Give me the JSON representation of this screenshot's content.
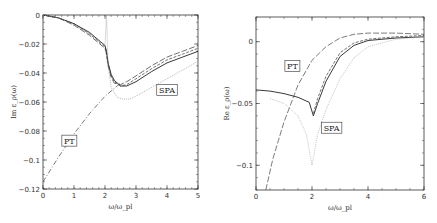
{
  "chart_data": [
    {
      "type": "line",
      "panel": "left",
      "ylabel": "Im ε_ρ(ω)",
      "xlabel": "ω/ω_pl",
      "xlim": [
        0,
        5
      ],
      "ylim": [
        -0.12,
        0
      ],
      "xticks": [
        "0",
        "1",
        "2",
        "3",
        "4",
        "5"
      ],
      "yticks": [
        "0",
        "-0.02",
        "-0.04",
        "-0.06",
        "-0.08",
        "-0.1",
        "-0.12"
      ],
      "grid": false,
      "annotations": [
        {
          "text": "PT",
          "x": 0.85,
          "y": -0.087
        },
        {
          "text": "SPA",
          "x": 4.0,
          "y": -0.052
        }
      ],
      "series": [
        {
          "name": "solid",
          "style": "solid",
          "color": "#222222",
          "x": [
            0,
            0.5,
            1.0,
            1.5,
            2.0,
            2.05,
            2.1,
            2.2,
            2.3,
            2.5,
            2.7,
            3.0,
            3.5,
            4.0,
            4.5,
            5.0
          ],
          "y": [
            0,
            -0.002,
            -0.006,
            -0.012,
            -0.021,
            -0.025,
            -0.033,
            -0.041,
            -0.045,
            -0.049,
            -0.049,
            -0.046,
            -0.039,
            -0.033,
            -0.029,
            -0.025
          ]
        },
        {
          "name": "dashed-short",
          "style": "dashed",
          "color": "#333333",
          "x": [
            0,
            0.5,
            1.0,
            1.5,
            2.0,
            2.05,
            2.1,
            2.2,
            2.3,
            2.5,
            2.7,
            3.0,
            3.5,
            4.0,
            4.5,
            5.0
          ],
          "y": [
            0,
            -0.002,
            -0.006,
            -0.013,
            -0.022,
            -0.026,
            -0.034,
            -0.042,
            -0.046,
            -0.049,
            -0.048,
            -0.044,
            -0.037,
            -0.031,
            -0.027,
            -0.023
          ]
        },
        {
          "name": "dashed-long",
          "style": "longdash",
          "color": "#333333",
          "x": [
            0,
            0.5,
            1.0,
            1.5,
            2.0,
            2.05,
            2.1,
            2.2,
            2.3,
            2.5,
            2.7,
            3.0,
            3.5,
            4.0,
            4.5,
            5.0
          ],
          "y": [
            0,
            -0.002,
            -0.007,
            -0.014,
            -0.023,
            -0.027,
            -0.035,
            -0.043,
            -0.047,
            -0.048,
            -0.046,
            -0.042,
            -0.035,
            -0.029,
            -0.025,
            -0.021
          ]
        },
        {
          "name": "SPA",
          "style": "dotted",
          "color": "#999999",
          "x": [
            0,
            0.5,
            1.0,
            1.5,
            2.0,
            2.05,
            2.1,
            2.2,
            2.4,
            2.6,
            2.8,
            3.0,
            3.5,
            4.0,
            4.5,
            5.0
          ],
          "y": [
            0,
            -0.002,
            -0.007,
            -0.013,
            -0.021,
            0,
            -0.035,
            -0.05,
            -0.057,
            -0.058,
            -0.058,
            -0.056,
            -0.05,
            -0.044,
            -0.038,
            -0.032
          ]
        },
        {
          "name": "PT",
          "style": "dashdot",
          "color": "#444444",
          "x": [
            0,
            0.5,
            1.0,
            1.5,
            2.0,
            2.5
          ],
          "y": [
            -0.115,
            -0.098,
            -0.082,
            -0.068,
            -0.056,
            -0.047
          ]
        }
      ]
    },
    {
      "type": "line",
      "panel": "right",
      "ylabel": "Re ε_ρ(ω)",
      "xlabel": "ω/ω_pl",
      "xlim": [
        0,
        6
      ],
      "ylim": [
        -0.12,
        0.02
      ],
      "xticks": [
        "0",
        "2",
        "4",
        "6"
      ],
      "yticks": [
        "0",
        "-0.05",
        "-0.1"
      ],
      "grid": false,
      "annotations": [
        {
          "text": "PT",
          "x": 1.3,
          "y": -0.02
        },
        {
          "text": "SPA",
          "x": 2.7,
          "y": -0.07
        }
      ],
      "series": [
        {
          "name": "solid",
          "style": "solid",
          "color": "#222222",
          "x": [
            0,
            0.5,
            1.0,
            1.5,
            1.9,
            2.05,
            2.2,
            2.5,
            3.0,
            3.5,
            4.0,
            5.0,
            6.0
          ],
          "y": [
            -0.039,
            -0.04,
            -0.042,
            -0.045,
            -0.049,
            -0.06,
            -0.05,
            -0.032,
            -0.012,
            -0.003,
            0.001,
            0.003,
            0.004
          ]
        },
        {
          "name": "dashed-short",
          "style": "dashed",
          "color": "#333333",
          "x": [
            2.05,
            2.2,
            2.5,
            3.0,
            3.5,
            4.0,
            5.0,
            6.0
          ],
          "y": [
            -0.058,
            -0.046,
            -0.028,
            -0.009,
            -0.001,
            0.002,
            0.004,
            0.005
          ]
        },
        {
          "name": "SPA",
          "style": "dotted",
          "color": "#aaaaaa",
          "x": [
            0.5,
            1.0,
            1.5,
            1.8,
            2.0,
            2.2,
            2.5,
            3.0,
            3.5,
            4.0,
            5.0,
            6.0
          ],
          "y": [
            -0.046,
            -0.05,
            -0.06,
            -0.075,
            -0.1,
            -0.075,
            -0.055,
            -0.03,
            -0.013,
            -0.004,
            0.002,
            0.004
          ]
        },
        {
          "name": "PT",
          "style": "longdash",
          "color": "#444444",
          "x": [
            0.35,
            0.6,
            1.0,
            1.5,
            2.0,
            2.5,
            3.0,
            3.5,
            4.0,
            5.0,
            6.0
          ],
          "y": [
            -0.12,
            -0.095,
            -0.065,
            -0.035,
            -0.015,
            -0.004,
            0.003,
            0.006,
            0.007,
            0.007,
            0.006
          ]
        }
      ]
    }
  ]
}
